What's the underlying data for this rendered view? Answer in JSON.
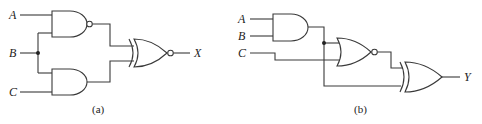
{
  "figure": {
    "circuit_a": {
      "caption": "(a)",
      "inputs": [
        "A",
        "B",
        "C"
      ],
      "output": "X",
      "gates": [
        {
          "type": "NAND",
          "inputs": [
            "A",
            "B"
          ]
        },
        {
          "type": "AND",
          "inputs": [
            "B",
            "C"
          ]
        },
        {
          "type": "XNOR",
          "inputs": [
            "NAND output",
            "AND output"
          ],
          "output": "X"
        }
      ]
    },
    "circuit_b": {
      "caption": "(b)",
      "inputs": [
        "A",
        "B",
        "C"
      ],
      "output": "Y",
      "gates": [
        {
          "type": "AND",
          "inputs": [
            "A",
            "B"
          ]
        },
        {
          "type": "NOR",
          "inputs": [
            "AND output",
            "C"
          ]
        },
        {
          "type": "XOR",
          "inputs": [
            "NOR output",
            "AND output"
          ],
          "output": "Y"
        }
      ]
    }
  },
  "colors": {
    "line": "#3a3a3a",
    "background": "#ffffff"
  }
}
